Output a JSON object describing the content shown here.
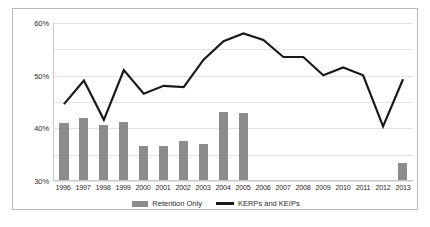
{
  "chart_data": {
    "type": "bar",
    "title": "",
    "xlabel": "",
    "ylabel": "",
    "ylim": [
      0,
      60
    ],
    "ytick_labels": [
      "0%",
      "10%",
      "20%",
      "30%",
      "40%",
      "50%",
      "60%"
    ],
    "ytick_values": [
      0,
      10,
      20,
      30,
      40,
      50,
      60
    ],
    "grid": true,
    "legend_position": "bottom-center",
    "categories": [
      "1996",
      "1997",
      "1998",
      "1999",
      "2000",
      "2001",
      "2002",
      "2003",
      "2004",
      "2005",
      "2006",
      "2007",
      "2008",
      "2009",
      "2010",
      "2011",
      "2012",
      "2013"
    ],
    "series": [
      {
        "name": "Retention Only",
        "type": "bar",
        "color": "#8c8c8c",
        "values": [
          21.5,
          23.5,
          21,
          22,
          13,
          13,
          15,
          13.5,
          26,
          25.5,
          null,
          null,
          null,
          null,
          null,
          null,
          null,
          6.5
        ]
      },
      {
        "name": "KERPs and KEIPs",
        "type": "line",
        "color": "#1a1a1a",
        "values": [
          29,
          38,
          23,
          42,
          33,
          36,
          35.5,
          46,
          53,
          56,
          53.5,
          47,
          47,
          40,
          43,
          40,
          20.5,
          38.5
        ]
      }
    ]
  },
  "legend": {
    "items": [
      {
        "label": "Retention Only",
        "swatch": "bar-swatch"
      },
      {
        "label": "KERPs and KEIPs",
        "swatch": "line-swatch"
      }
    ]
  }
}
